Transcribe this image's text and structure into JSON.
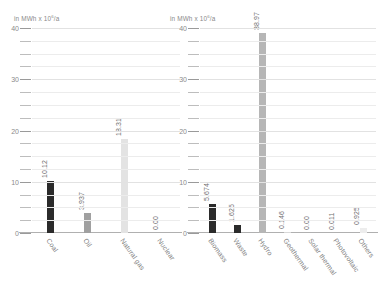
{
  "axis_unit": {
    "prefix": "in MWh x 10",
    "exponent": "6",
    "suffix": "/a",
    "full": "in MWh x 10⁶/a"
  },
  "chart_data": [
    {
      "type": "bar",
      "title": "",
      "panel": "left",
      "xlabel": "",
      "ylabel": "in MWh x 10⁶/a",
      "ylim": [
        0,
        40
      ],
      "yticks": [
        0,
        10,
        20,
        30,
        40
      ],
      "ytick_labels": [
        "0",
        "10",
        "20",
        "30",
        "40"
      ],
      "minor_tick_step": 2.5,
      "grid": true,
      "legend": "none",
      "categories": [
        "Coal",
        "Oil",
        "Natural gas",
        "Nuclear"
      ],
      "values": [
        10.12,
        3.937,
        18.31,
        0.0
      ],
      "value_labels": [
        "10.12",
        "3.937",
        "18.31",
        "0.00"
      ],
      "colors": [
        "#2b2b2b",
        "#a0a0a0",
        "#e3e3e3",
        "#ffffff"
      ]
    },
    {
      "type": "bar",
      "title": "",
      "panel": "right",
      "xlabel": "",
      "ylabel": "in MWh x 10⁶/a",
      "ylim": [
        0,
        40
      ],
      "yticks": [
        0,
        10,
        20,
        30,
        40
      ],
      "ytick_labels": [
        "0",
        "10",
        "20",
        "30",
        "40"
      ],
      "minor_tick_step": 2.5,
      "grid": true,
      "legend": "none",
      "categories": [
        "Biomass",
        "Waste",
        "Hydro",
        "Geothermal",
        "Solar thermal",
        "Photovoltaic",
        "Others"
      ],
      "values": [
        5.674,
        1.625,
        38.97,
        0.146,
        0.0,
        0.011,
        0.925
      ],
      "value_labels": [
        "5.674",
        "1.625",
        "38.97",
        "0.146",
        "0.00",
        "0.011",
        "0.925"
      ],
      "colors": [
        "#2b2b2b",
        "#2b2b2b",
        "#b6b6b6",
        "#d8d8d8",
        "#ffffff",
        "#e8e8e8",
        "#ededed"
      ]
    }
  ],
  "style": {
    "background": "#ffffff",
    "grid_color": "#ececec",
    "axis_color": "#b0b0b0",
    "text_color": "#7d7d7d"
  }
}
